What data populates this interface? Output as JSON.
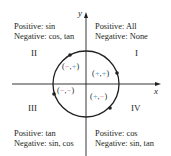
{
  "axes": {
    "x_label": "x",
    "y_label": "y"
  },
  "quadrants": {
    "I": {
      "numeral": "I",
      "positive": "Positive: All",
      "negative": "Negative: None",
      "signs": {
        "open": "(",
        "first": "+",
        "comma": ",",
        "second": "+",
        "close": ")"
      }
    },
    "II": {
      "numeral": "II",
      "positive": "Positive: sin",
      "negative": "Negative: cos, tan",
      "signs": {
        "open": "(",
        "first": "−",
        "comma": ",",
        "second": "+",
        "close": ")"
      }
    },
    "III": {
      "numeral": "III",
      "positive": "Positive: tan",
      "negative": "Negative: sin, cos",
      "signs": {
        "open": "(",
        "first": "−",
        "comma": ",",
        "second": "−",
        "close": ")"
      }
    },
    "IV": {
      "numeral": "IV",
      "positive": "Positive: cos",
      "negative": "Negative: sin, tan",
      "signs": {
        "open": "(",
        "first": "+",
        "comma": ",",
        "second": "−",
        "close": ")"
      }
    }
  },
  "colors": {
    "positive_sign": "#4a9fd8",
    "negative_sign": "#e06a8a",
    "line": "#231f20"
  }
}
